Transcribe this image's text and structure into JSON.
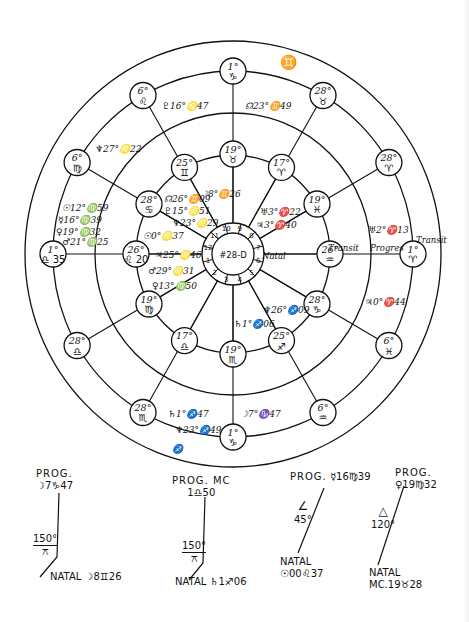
{
  "chart": {
    "id_label": "#28-D",
    "center": [
      233,
      254
    ],
    "rings": {
      "outer": 210,
      "second": 180,
      "third": 138,
      "fourth": 97,
      "hub_outer": 31,
      "hub_inner": 21
    },
    "ring_labels": {
      "natal": "Natal",
      "transit_inner": "Transit",
      "progressed": "Progres",
      "transit_outer": "Transit",
      "gemini_glyph": "♊"
    },
    "houses": [
      "1",
      "2",
      "3",
      "4",
      "5",
      "6",
      "7",
      "8",
      "9",
      "10",
      "11",
      "12"
    ],
    "outer_cusps": [
      {
        "deg": "1°",
        "sign": "♑",
        "angle": 90
      },
      {
        "deg": "28°",
        "sign": "♉",
        "angle": 60
      },
      {
        "deg": "28°",
        "sign": "♈",
        "angle": 30
      },
      {
        "deg": "1°",
        "sign": "♈",
        "angle": 0
      },
      {
        "deg": "6°",
        "sign": "♓",
        "angle": -30
      },
      {
        "deg": "6°",
        "sign": "♒",
        "angle": -60
      },
      {
        "deg": "1°",
        "sign": "♑",
        "angle": -90
      },
      {
        "deg": "28°",
        "sign": "♏",
        "angle": -120
      },
      {
        "deg": "28°",
        "sign": "♎",
        "angle": -150
      },
      {
        "deg": "1°",
        "sign": "♎ 35",
        "angle": 180
      },
      {
        "deg": "6°",
        "sign": "♍",
        "angle": 150
      },
      {
        "deg": "6°",
        "sign": "♌",
        "angle": 120
      }
    ],
    "inner_cusps": [
      {
        "deg": "19°",
        "sign": "♉",
        "angle": 90
      },
      {
        "deg": "17°",
        "sign": "♈",
        "angle": 60
      },
      {
        "deg": "19°",
        "sign": "♓",
        "angle": 30
      },
      {
        "deg": "26°",
        "sign": "♒",
        "angle": 0
      },
      {
        "deg": "28°",
        "sign": "♑",
        "angle": -30
      },
      {
        "deg": "25°",
        "sign": "♐",
        "angle": -60
      },
      {
        "deg": "19°",
        "sign": "♏",
        "angle": -90
      },
      {
        "deg": "17°",
        "sign": "♎",
        "angle": -120
      },
      {
        "deg": "19°",
        "sign": "♍",
        "angle": -150
      },
      {
        "deg": "26°",
        "sign": "♌ 20",
        "angle": 180
      },
      {
        "deg": "28°",
        "sign": "♋",
        "angle": 150
      },
      {
        "deg": "25°",
        "sign": "♊",
        "angle": 120
      }
    ],
    "planet_labels": [
      {
        "text": "♇16°♌47",
        "x": 162,
        "y": 102
      },
      {
        "text": "☊23°♊49",
        "x": 245,
        "y": 102
      },
      {
        "text": "♆27°♌22",
        "x": 95,
        "y": 145
      },
      {
        "text": "☊26°♊09",
        "x": 164,
        "y": 195
      },
      {
        "text": "☽8°♊26",
        "x": 200,
        "y": 190
      },
      {
        "text": "♇15°♌51",
        "x": 164,
        "y": 207
      },
      {
        "text": "♆23°♌29",
        "x": 172,
        "y": 219
      },
      {
        "text": "☉0°♌37",
        "x": 143,
        "y": 232
      },
      {
        "text": "♃25°♌46",
        "x": 155,
        "y": 251
      },
      {
        "text": "♂29°♌31",
        "x": 148,
        "y": 267
      },
      {
        "text": "♀13°♍50",
        "x": 152,
        "y": 282
      },
      {
        "text": "☉12°♍59",
        "x": 62,
        "y": 204
      },
      {
        "text": "☿16°♍39",
        "x": 58,
        "y": 216
      },
      {
        "text": "♀19°♍32",
        "x": 56,
        "y": 228
      },
      {
        "text": "♂21°♍25",
        "x": 62,
        "y": 238
      },
      {
        "text": "♅3°♈22",
        "x": 260,
        "y": 208
      },
      {
        "text": "♃3°♈40",
        "x": 256,
        "y": 221
      },
      {
        "text": "♅2°♈13",
        "x": 368,
        "y": 226
      },
      {
        "text": "♃0°♈44",
        "x": 365,
        "y": 298
      },
      {
        "text": "♆26°♐09",
        "x": 263,
        "y": 306
      },
      {
        "text": "♄1°♐06",
        "x": 234,
        "y": 320
      },
      {
        "text": "♄1°♐47",
        "x": 168,
        "y": 410
      },
      {
        "text": "♆23°♐49",
        "x": 175,
        "y": 426
      },
      {
        "text": "☽7°♑47",
        "x": 240,
        "y": 410
      },
      {
        "text": "♐",
        "x": 172,
        "y": 445
      }
    ]
  },
  "aspects": [
    {
      "top_label": "PROG.",
      "top_value": "☽7♑47",
      "aspect_glyph": "⚻",
      "aspect_deg": "150°",
      "bottom_label": "NATAL",
      "bottom_value": "☽8♊26"
    },
    {
      "top_label": "PROG. MC",
      "top_value": "1♎50",
      "aspect_glyph": "⚻",
      "aspect_deg": "150°",
      "bottom_label": "NATAL",
      "bottom_value": "♄1♐06"
    },
    {
      "top_label": "PROG.",
      "top_value": "☿16♍39",
      "aspect_glyph": "∠",
      "aspect_deg": "45°",
      "bottom_label": "NATAL",
      "bottom_value": "☉00♌37"
    },
    {
      "top_label": "PROG.",
      "top_value": "♀19♍32",
      "aspect_glyph": "△",
      "aspect_deg": "120°",
      "bottom_label": "NATAL",
      "bottom_value": "MC.19♉28"
    }
  ]
}
